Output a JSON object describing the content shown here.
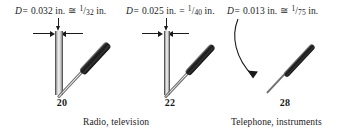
{
  "figure": {
    "background_color": "#ffffff",
    "ink_color": "#1a1a1a"
  },
  "gauges": [
    {
      "id": "gauge-20",
      "number": "20",
      "diameter_label": {
        "variable": "D",
        "equals": "=",
        "value": "0.032 in.",
        "approx_symbol": "≅",
        "fraction_numerator": "1",
        "fraction_slash": "/",
        "fraction_denominator": "32",
        "fraction_unit": "in.",
        "full_text": "D = 0.032 in. ≅ 1/32 in."
      }
    },
    {
      "id": "gauge-22",
      "number": "22",
      "diameter_label": {
        "variable": "D",
        "equals": "=",
        "value": "0.025 in.",
        "approx_symbol": "=",
        "fraction_numerator": "1",
        "fraction_slash": "/",
        "fraction_denominator": "40",
        "fraction_unit": "in.",
        "full_text": "D = 0.025 in. = 1/40 in."
      }
    },
    {
      "id": "gauge-28",
      "number": "28",
      "diameter_label": {
        "variable": "D",
        "equals": "=",
        "value": "0.013 in.",
        "approx_symbol": "≅",
        "fraction_numerator": "1",
        "fraction_slash": "/",
        "fraction_denominator": "75",
        "fraction_unit": "in.",
        "full_text": "D = 0.013 in. ≅ 1/75 in."
      }
    }
  ],
  "captions": [
    {
      "id": "caption-radio",
      "text": "Radio, television"
    },
    {
      "id": "caption-telephone",
      "text": "Telephone, instruments"
    }
  ]
}
